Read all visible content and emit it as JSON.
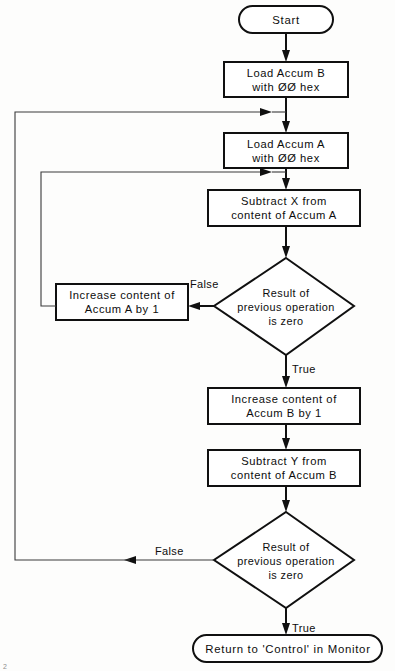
{
  "diagram": {
    "type": "flowchart",
    "colors": {
      "stroke": "#101010",
      "fill": "#ffffff",
      "background": "#fdfdfc",
      "loop_stroke": "#3a3a3a"
    },
    "nodes": [
      {
        "id": "start",
        "shape": "terminator",
        "lines": [
          "Start"
        ]
      },
      {
        "id": "load-accum-b",
        "shape": "process",
        "lines": [
          "Load Accum B",
          "with ØØ hex"
        ]
      },
      {
        "id": "load-accum-a",
        "shape": "process",
        "lines": [
          "Load Accum A",
          "with ØØ hex"
        ]
      },
      {
        "id": "subtract-x",
        "shape": "process",
        "lines": [
          "Subtract  X from",
          "content of  Accum  A"
        ]
      },
      {
        "id": "decision-a",
        "shape": "decision",
        "lines": [
          "Result of",
          "previous operation",
          "is zero"
        ]
      },
      {
        "id": "increase-accum-a",
        "shape": "process",
        "lines": [
          "Increase  content  of",
          "Accum  A  by  1"
        ]
      },
      {
        "id": "increase-accum-b",
        "shape": "process",
        "lines": [
          "Increase  content  of",
          "Accum  B  by  1"
        ]
      },
      {
        "id": "subtract-y",
        "shape": "process",
        "lines": [
          "Subtract   Y from",
          "content of  Accum  B"
        ]
      },
      {
        "id": "decision-b",
        "shape": "decision",
        "lines": [
          "Result of",
          "previous operation",
          "is zero"
        ]
      },
      {
        "id": "return-monitor",
        "shape": "terminator",
        "lines": [
          "Return  to 'Control' in  Monitor"
        ]
      }
    ],
    "edge_labels": {
      "decision_a_false": "False",
      "decision_a_true": "True",
      "decision_b_false": "False",
      "decision_b_true": "True"
    },
    "page_mark": "2"
  }
}
